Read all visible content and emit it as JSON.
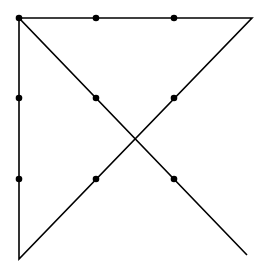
{
  "diagram": {
    "line_color": "#000000",
    "dot_color": "#000000",
    "dots": [
      {
        "x": 19,
        "y": 18
      },
      {
        "x": 96,
        "y": 18
      },
      {
        "x": 174,
        "y": 18
      },
      {
        "x": 19,
        "y": 98
      },
      {
        "x": 96,
        "y": 98
      },
      {
        "x": 174,
        "y": 98
      },
      {
        "x": 19,
        "y": 179
      },
      {
        "x": 96,
        "y": 179
      },
      {
        "x": 174,
        "y": 179
      }
    ],
    "path": [
      {
        "x": 247,
        "y": 255
      },
      {
        "x": 19,
        "y": 18
      },
      {
        "x": 252,
        "y": 18
      },
      {
        "x": 19,
        "y": 259
      },
      {
        "x": 19,
        "y": 18
      }
    ]
  }
}
